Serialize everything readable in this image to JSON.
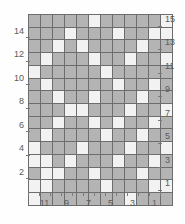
{
  "chart_data": {
    "type": "heatmap",
    "title": "",
    "subtitle": "",
    "xlabel": "",
    "ylabel": "",
    "grid": true,
    "legend_position": "none",
    "columns": 12,
    "rows": 15,
    "colors": {
      "light_cell": "#f2f2f2",
      "dark_cell": "#b4b4b4",
      "cell_border": "#6d6d6d",
      "label_text": "#5a5a5a",
      "background": "#fefefe"
    },
    "x_tick_labels": [
      "11",
      "9",
      "7",
      "5",
      "3",
      "1"
    ],
    "x_tick_columns": [
      2,
      4,
      6,
      8,
      10,
      12
    ],
    "x_axis_direction": "right-to-left",
    "y_tick_labels_left": [
      "14",
      "12",
      "10",
      "8",
      "6",
      "4",
      "2"
    ],
    "y_tick_rows_left": [
      14,
      12,
      10,
      8,
      6,
      4,
      2
    ],
    "y_tick_labels_right": [
      "15",
      "13",
      "11",
      "9",
      "7",
      "5",
      "3",
      "1"
    ],
    "y_tick_rows_right": [
      15,
      13,
      11,
      9,
      7,
      5,
      3,
      1
    ],
    "y_axis_direction": "bottom-to-top",
    "value_legend": {
      "0": "light",
      "1": "dark"
    },
    "cells": [
      [
        1,
        1,
        1,
        1,
        1,
        0,
        1,
        1,
        1,
        1,
        1,
        0
      ],
      [
        1,
        1,
        1,
        0,
        1,
        1,
        1,
        0,
        1,
        1,
        0,
        0
      ],
      [
        1,
        1,
        0,
        1,
        0,
        1,
        1,
        1,
        1,
        0,
        1,
        1
      ],
      [
        1,
        0,
        1,
        1,
        1,
        0,
        1,
        1,
        0,
        1,
        1,
        0
      ],
      [
        0,
        1,
        1,
        1,
        1,
        1,
        0,
        1,
        1,
        1,
        1,
        1
      ],
      [
        1,
        0,
        1,
        1,
        1,
        1,
        1,
        0,
        1,
        1,
        0,
        1
      ],
      [
        1,
        1,
        0,
        1,
        1,
        0,
        1,
        1,
        1,
        0,
        1,
        1
      ],
      [
        1,
        1,
        1,
        0,
        0,
        1,
        1,
        1,
        0,
        1,
        1,
        0
      ],
      [
        1,
        1,
        0,
        1,
        1,
        0,
        1,
        0,
        1,
        1,
        0,
        1
      ],
      [
        1,
        0,
        1,
        1,
        1,
        1,
        0,
        1,
        1,
        0,
        1,
        1
      ],
      [
        0,
        1,
        1,
        1,
        0,
        1,
        1,
        1,
        0,
        1,
        1,
        0
      ],
      [
        0,
        0,
        1,
        0,
        1,
        1,
        1,
        0,
        1,
        1,
        0,
        1
      ],
      [
        1,
        0,
        0,
        1,
        1,
        0,
        1,
        1,
        1,
        0,
        1,
        1
      ],
      [
        0,
        0,
        1,
        1,
        1,
        1,
        0,
        1,
        1,
        1,
        0,
        0
      ],
      [
        0,
        1,
        1,
        1,
        1,
        1,
        1,
        1,
        0,
        1,
        1,
        1
      ]
    ],
    "rows_top_to_bottom": [
      15,
      14,
      13,
      12,
      11,
      10,
      9,
      8,
      7,
      6,
      5,
      4,
      3,
      2,
      1
    ]
  }
}
